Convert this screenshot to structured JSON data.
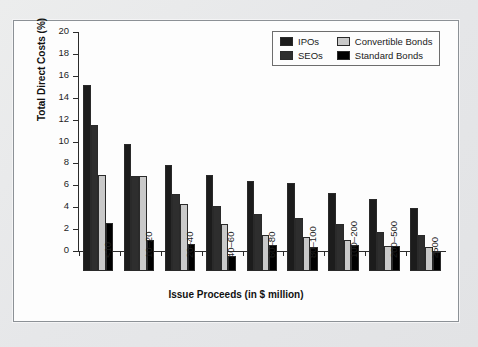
{
  "chart_data": {
    "type": "bar",
    "title": "",
    "xlabel": "Issue Proceeds (in $ million)",
    "ylabel": "Total Direct Costs (%)",
    "ylim": [
      0,
      20
    ],
    "ytick_step": 2,
    "yticks": [
      0,
      2,
      4,
      6,
      8,
      10,
      12,
      14,
      16,
      18,
      20
    ],
    "ytick_labels": [
      "0",
      "2",
      "4",
      "6",
      "8",
      "10",
      "12",
      "14",
      "16",
      "18",
      "20"
    ],
    "grid": false,
    "legend_position": "top-right",
    "categories": [
      "<10",
      "10–20",
      "20–40",
      "40–60",
      "60–80",
      "80–100",
      "100–200",
      "200–500",
      "≥500"
    ],
    "series": [
      {
        "name": "IPOs",
        "color": "#1c1c1c",
        "values": [
          17.0,
          11.6,
          9.7,
          8.8,
          8.2,
          8.0,
          7.1,
          6.6,
          5.8
        ]
      },
      {
        "name": "SEOs",
        "color": "#2e2e2e",
        "values": [
          13.3,
          8.7,
          7.0,
          5.9,
          5.2,
          4.8,
          4.3,
          3.6,
          3.25
        ]
      },
      {
        "name": "Convertible Bonds",
        "color": "#c9c9c9",
        "values": [
          8.8,
          8.7,
          6.1,
          4.3,
          3.3,
          3.1,
          2.85,
          2.25,
          2.15
        ]
      },
      {
        "name": "Standard Bonds",
        "color": "#000000",
        "values": [
          4.4,
          2.8,
          2.45,
          1.4,
          2.4,
          2.2,
          2.4,
          2.3,
          1.75
        ]
      }
    ]
  },
  "legend": {
    "entries": [
      {
        "label": "IPOs",
        "swatch": "legend-swatch-ipos"
      },
      {
        "label": "Convertible Bonds",
        "swatch": "legend-swatch-convertible-bonds"
      },
      {
        "label": "SEOs",
        "swatch": "legend-swatch-seos"
      },
      {
        "label": "Standard Bonds",
        "swatch": "legend-swatch-standard-bonds"
      }
    ]
  }
}
